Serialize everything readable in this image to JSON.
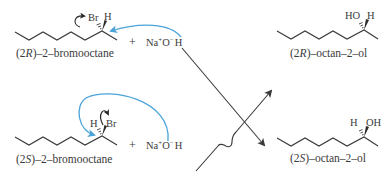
{
  "diagram": {
    "type": "reaction-scheme",
    "colors": {
      "bond": "#3a3a3a",
      "text": "#3a3a3a",
      "curved_arrow": "#4aa3d9",
      "reaction_arrow": "#3a3a3a"
    },
    "reactants": [
      {
        "name": "(2R)–2–bromooctane",
        "name_parts": {
          "prefix": "(2",
          "stereo": "R",
          "suffix": ")–2–bromooctane"
        },
        "substituent_left": "Br",
        "substituent_right": "H",
        "reagent": {
          "plus": "+",
          "na": "Na",
          "na_charge": "+",
          "o": "O",
          "o_charge": "−",
          "h": "H"
        }
      },
      {
        "name": "(2S)–2–bromooctane",
        "name_parts": {
          "prefix": "(2",
          "stereo": "S",
          "suffix": ")–2–bromooctane"
        },
        "substituent_left": "H",
        "substituent_right": "Br",
        "reagent": {
          "plus": "+",
          "na": "Na",
          "na_charge": "+",
          "o": "O",
          "o_charge": "−",
          "h": "H"
        }
      }
    ],
    "products": [
      {
        "name": "(2R)–octan–2–ol",
        "name_parts": {
          "prefix": "(2",
          "stereo": "R",
          "suffix": ")–octan–2–ol"
        },
        "substituent_left": "HO",
        "substituent_right": "H"
      },
      {
        "name": "(2S)–octan–2–ol",
        "name_parts": {
          "prefix": "(2",
          "stereo": "S",
          "suffix": ")–octan–2–ol"
        },
        "substituent_left": "H",
        "substituent_right": "OH"
      }
    ],
    "arrows": [
      {
        "from": "(2S)–2–bromooctane + NaOH",
        "to": "(2R)–octan–2–ol",
        "style": "straight, hops over crossing"
      },
      {
        "from": "(2R)–2–bromooctane + NaOH",
        "to": "(2S)–octan–2–ol",
        "style": "straight"
      }
    ]
  }
}
